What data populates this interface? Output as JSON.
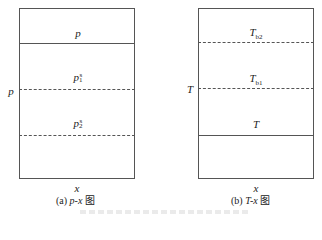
{
  "panel_a": {
    "y_axis_label": "p",
    "x_axis_label": "x",
    "top_label": "p",
    "mid_label": "p",
    "mid_sup": "s",
    "mid_sub": "1",
    "low_label": "p",
    "low_sup": "s",
    "low_sub": "2",
    "caption_prefix": "(a) ",
    "caption_var": "p-x",
    "caption_suffix": " 图"
  },
  "panel_b": {
    "y_axis_label": "T",
    "x_axis_label": "x",
    "top_label": "T",
    "top_sub": "b2",
    "mid_label": "T",
    "mid_sub": "b1",
    "low_label": "T",
    "caption_prefix": "(b) ",
    "caption_var": "T-x",
    "caption_suffix": " 图"
  }
}
